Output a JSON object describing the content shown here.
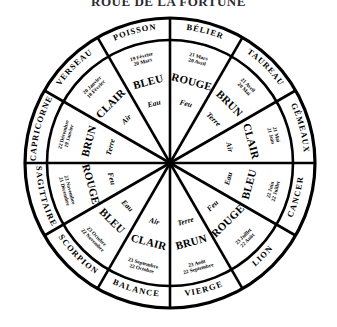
{
  "title": "ROUE DE LA FORTUNE",
  "diagram": {
    "type": "zodiac-wheel",
    "shape": "circle divided into 12 equal sectors with an outer annulus band",
    "center": {
      "x": 170,
      "y": 163
    },
    "outer_radius": 145,
    "inner_ring_radius": 123,
    "sector_count": 12,
    "labels": {
      "band": "sign name",
      "inner_top": "date range",
      "inner_middle": "colour",
      "inner_bottom": "element"
    }
  },
  "signs": [
    {
      "name": "BÉLIER",
      "date_start": "21 Mars",
      "date_end": "20 Avril",
      "color_word": "ROUGE",
      "element": "Feu",
      "angle_deg": -75
    },
    {
      "name": "TAUREAU",
      "date_start": "21 Avril",
      "date_end": "20 Mai",
      "color_word": "BRUN",
      "element": "Terre",
      "angle_deg": -45
    },
    {
      "name": "GÉMEAUX",
      "date_start": "21 Mai",
      "date_end": "21 Juin",
      "color_word": "CLAIR",
      "element": "Air",
      "angle_deg": -15
    },
    {
      "name": "CANCER",
      "date_start": "22 Juin",
      "date_end": "22 Juillet",
      "color_word": "BLEU",
      "element": "Eau",
      "angle_deg": 15
    },
    {
      "name": "LION",
      "date_start": "23 Juillet",
      "date_end": "22 Août",
      "color_word": "ROUGE",
      "element": "Feu",
      "angle_deg": 45
    },
    {
      "name": "VIERGE",
      "date_start": "23 Août",
      "date_end": "22 Septembre",
      "color_word": "BRUN",
      "element": "Terre",
      "angle_deg": 75
    },
    {
      "name": "BALANCE",
      "date_start": "23 Septembre",
      "date_end": "22 Octobre",
      "color_word": "CLAIR",
      "element": "Air",
      "angle_deg": 105
    },
    {
      "name": "SCORPION",
      "date_start": "23 Octobre",
      "date_end": "22 Novembre",
      "color_word": "BLEU",
      "element": "Eau",
      "angle_deg": 135
    },
    {
      "name": "SAGITTAIRE",
      "date_start": "23 Novembre",
      "date_end": "21 Décembre",
      "color_word": "ROUGE",
      "element": "Feu",
      "angle_deg": 165
    },
    {
      "name": "CAPRICORNE",
      "date_start": "22 Décembre",
      "date_end": "19 Janvier",
      "color_word": "BRUN",
      "element": "Terre",
      "angle_deg": 195
    },
    {
      "name": "VERSEAU",
      "date_start": "20 Janvier",
      "date_end": "18 Février",
      "color_word": "CLAIR",
      "element": "Air",
      "angle_deg": 225
    },
    {
      "name": "POISSON",
      "date_start": "19 Février",
      "date_end": "20 Mars",
      "color_word": "BLEU",
      "element": "Eau",
      "angle_deg": 255
    }
  ],
  "colors": {
    "stroke": "#000000",
    "background": "#ffffff",
    "title": "#2b2b33"
  }
}
